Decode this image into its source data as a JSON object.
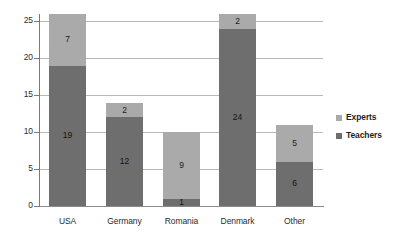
{
  "chart_data": {
    "type": "bar",
    "stacked": true,
    "title": "",
    "subtitle": "",
    "xlabel": "",
    "ylabel": "",
    "categories": [
      "USA",
      "Germany",
      "Romania",
      "Denmark",
      "Other"
    ],
    "series": [
      {
        "name": "Teachers",
        "color": "#6e6e6e",
        "values": [
          19,
          12,
          1,
          24,
          6
        ]
      },
      {
        "name": "Experts",
        "color": "#aaaaaa",
        "values": [
          7,
          2,
          9,
          2,
          5
        ]
      }
    ],
    "totals": [
      26,
      14,
      10,
      26,
      11
    ],
    "ylim": [
      0,
      26
    ],
    "yticks": [
      0,
      5,
      10,
      15,
      20,
      25
    ],
    "ytick_labels": [
      "0",
      "5",
      "10",
      "15",
      "20",
      "25"
    ],
    "grid": true,
    "grid_axis": "y",
    "legend_position": "right",
    "legend_order": [
      "Experts",
      "Teachers"
    ],
    "data_labels": {
      "USA": {
        "Teachers": "19",
        "Experts": "7"
      },
      "Germany": {
        "Teachers": "12",
        "Experts": "2"
      },
      "Romania": {
        "Teachers": "1",
        "Experts": "9"
      },
      "Denmark": {
        "Teachers": "24",
        "Experts": "2"
      },
      "Other": {
        "Teachers": "6",
        "Experts": "5"
      }
    },
    "colors": {
      "teachers": "#6e6e6e",
      "experts": "#aaaaaa",
      "gridline": "#b9b9b9",
      "axis": "#7a7a7a",
      "background": "#ffffff",
      "text": "#222222"
    }
  }
}
